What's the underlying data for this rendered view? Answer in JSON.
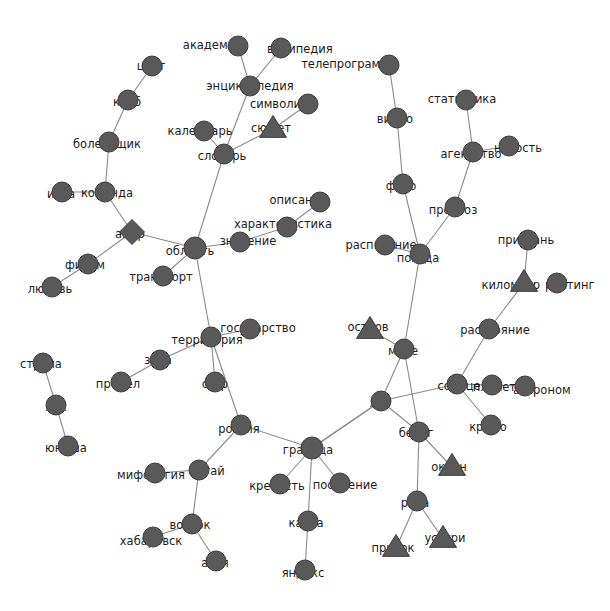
{
  "graph": {
    "title": "",
    "background_color": "#ffffff",
    "node_color": "#595959",
    "node_border_color": "#3c3c3c",
    "edge_color": "#8a8a8a",
    "label_color": "#1b1b1b",
    "width": 610,
    "height": 611,
    "shape_legend": {
      "circle": "circle-node",
      "triangle": "triangle-node",
      "diamond": "diamond-node"
    },
    "nodes": [
      {
        "id": "akademik",
        "label": "академик",
        "x": 238,
        "y": 46,
        "r": 10,
        "shape": "circle",
        "label_anchor": "end",
        "label_dx": 4,
        "label_dy": -1
      },
      {
        "id": "wikipedia",
        "label": "википедия",
        "x": 281,
        "y": 48,
        "r": 10,
        "shape": "circle",
        "label_anchor": "start",
        "label_dx": -14,
        "label_dy": 1
      },
      {
        "id": "entsiklopediya",
        "label": "энциклопедия",
        "x": 250,
        "y": 86,
        "r": 10,
        "shape": "circle",
        "label_anchor": "middle",
        "label_dx": 0,
        "label_dy": 0
      },
      {
        "id": "simvolika",
        "label": "символика",
        "x": 308,
        "y": 104,
        "r": 10,
        "shape": "circle",
        "label_anchor": "end",
        "label_dx": 7,
        "label_dy": 0
      },
      {
        "id": "syuzhet",
        "label": "сюжет",
        "x": 273,
        "y": 129,
        "r": 10,
        "shape": "triangle",
        "label_anchor": "middle",
        "label_dx": -2,
        "label_dy": -1
      },
      {
        "id": "kalendar",
        "label": "календарь",
        "x": 204,
        "y": 131,
        "r": 10,
        "shape": "circle",
        "label_anchor": "middle",
        "label_dx": -4,
        "label_dy": 0
      },
      {
        "id": "slovar",
        "label": "словарь",
        "x": 224,
        "y": 154,
        "r": 10,
        "shape": "circle",
        "label_anchor": "middle",
        "label_dx": -2,
        "label_dy": 2
      },
      {
        "id": "tsvet",
        "label": "цвет",
        "x": 152,
        "y": 66,
        "r": 10,
        "shape": "circle",
        "label_anchor": "middle",
        "label_dx": -1,
        "label_dy": 0
      },
      {
        "id": "klub",
        "label": "клуб",
        "x": 128,
        "y": 100,
        "r": 10,
        "shape": "circle",
        "label_anchor": "middle",
        "label_dx": -1,
        "label_dy": 2
      },
      {
        "id": "bolelshchik",
        "label": "болельщик",
        "x": 109,
        "y": 142,
        "r": 10,
        "shape": "circle",
        "label_anchor": "middle",
        "label_dx": -2,
        "label_dy": 2
      },
      {
        "id": "komanda",
        "label": "команда",
        "x": 105,
        "y": 192,
        "r": 10,
        "shape": "circle",
        "label_anchor": "middle",
        "label_dx": 2,
        "label_dy": 1
      },
      {
        "id": "igra",
        "label": "игра",
        "x": 62,
        "y": 192,
        "r": 10,
        "shape": "circle",
        "label_anchor": "middle",
        "label_dx": -1,
        "label_dy": 2
      },
      {
        "id": "amur",
        "label": "амур",
        "x": 132,
        "y": 232,
        "r": 10,
        "shape": "diamond",
        "label_anchor": "middle",
        "label_dx": -2,
        "label_dy": 2
      },
      {
        "id": "film",
        "label": "фильм",
        "x": 88,
        "y": 264,
        "r": 10,
        "shape": "circle",
        "label_anchor": "middle",
        "label_dx": -3,
        "label_dy": 1
      },
      {
        "id": "lyubov",
        "label": "любовь",
        "x": 52,
        "y": 287,
        "r": 10,
        "shape": "circle",
        "label_anchor": "middle",
        "label_dx": -2,
        "label_dy": 2
      },
      {
        "id": "oblast",
        "label": "область",
        "x": 195,
        "y": 248,
        "r": 11,
        "shape": "circle",
        "label_anchor": "middle",
        "label_dx": -5,
        "label_dy": 3
      },
      {
        "id": "znachenie",
        "label": "значение",
        "x": 240,
        "y": 242,
        "r": 10,
        "shape": "circle",
        "label_anchor": "middle",
        "label_dx": 8,
        "label_dy": -1
      },
      {
        "id": "harakteristika",
        "label": "характеристика",
        "x": 287,
        "y": 227,
        "r": 10,
        "shape": "circle",
        "label_anchor": "middle",
        "label_dx": -4,
        "label_dy": -3
      },
      {
        "id": "opisanie",
        "label": "описание",
        "x": 320,
        "y": 202,
        "r": 10,
        "shape": "circle",
        "label_anchor": "end",
        "label_dx": 7,
        "label_dy": -2
      },
      {
        "id": "transport",
        "label": "транспорт",
        "x": 163,
        "y": 276,
        "r": 10,
        "shape": "circle",
        "label_anchor": "middle",
        "label_dx": -2,
        "label_dy": 1
      },
      {
        "id": "territoriya",
        "label": "территория",
        "x": 211,
        "y": 337,
        "r": 10,
        "shape": "circle",
        "label_anchor": "middle",
        "label_dx": -4,
        "label_dy": 3
      },
      {
        "id": "gosudarstvo",
        "label": "государство",
        "x": 250,
        "y": 329,
        "r": 10,
        "shape": "circle",
        "label_anchor": "middle",
        "label_dx": 8,
        "label_dy": -1
      },
      {
        "id": "zona",
        "label": "зона",
        "x": 160,
        "y": 360,
        "r": 10,
        "shape": "circle",
        "label_anchor": "middle",
        "label_dx": -2,
        "label_dy": 0
      },
      {
        "id": "predel",
        "label": "предел",
        "x": 121,
        "y": 382,
        "r": 10,
        "shape": "circle",
        "label_anchor": "middle",
        "label_dx": -3,
        "label_dy": 2
      },
      {
        "id": "sssr",
        "label": "ссср",
        "x": 215,
        "y": 382,
        "r": 10,
        "shape": "circle",
        "label_anchor": "middle",
        "label_dx": 0,
        "label_dy": 2
      },
      {
        "id": "rossiya",
        "label": "россия",
        "x": 241,
        "y": 425,
        "r": 10,
        "shape": "circle",
        "label_anchor": "middle",
        "label_dx": -2,
        "label_dy": 4
      },
      {
        "id": "strela",
        "label": "стрела",
        "x": 43,
        "y": 363,
        "r": 10,
        "shape": "circle",
        "label_anchor": "middle",
        "label_dx": -2,
        "label_dy": 1
      },
      {
        "id": "luk",
        "label": "лук",
        "x": 56,
        "y": 405,
        "r": 10,
        "shape": "circle",
        "label_anchor": "middle",
        "label_dx": 0,
        "label_dy": 2
      },
      {
        "id": "yunosha",
        "label": "юноша",
        "x": 68,
        "y": 446,
        "r": 10,
        "shape": "circle",
        "label_anchor": "middle",
        "label_dx": -2,
        "label_dy": 2
      },
      {
        "id": "mifologiya",
        "label": "мифология",
        "x": 155,
        "y": 473,
        "r": 10,
        "shape": "circle",
        "label_anchor": "middle",
        "label_dx": -4,
        "label_dy": 2
      },
      {
        "id": "altay",
        "label": "алтай",
        "x": 199,
        "y": 470,
        "r": 10,
        "shape": "circle",
        "label_anchor": "middle",
        "label_dx": 8,
        "label_dy": 1
      },
      {
        "id": "vostok",
        "label": "восток",
        "x": 192,
        "y": 524,
        "r": 10,
        "shape": "circle",
        "label_anchor": "middle",
        "label_dx": -2,
        "label_dy": 1
      },
      {
        "id": "habarovsk",
        "label": "хабаровск",
        "x": 153,
        "y": 537,
        "r": 10,
        "shape": "circle",
        "label_anchor": "middle",
        "label_dx": -2,
        "label_dy": 4
      },
      {
        "id": "aziya",
        "label": "азия",
        "x": 216,
        "y": 561,
        "r": 10,
        "shape": "circle",
        "label_anchor": "middle",
        "label_dx": -1,
        "label_dy": 2
      },
      {
        "id": "granitsa",
        "label": "граница",
        "x": 312,
        "y": 448,
        "r": 11,
        "shape": "circle",
        "label_anchor": "middle",
        "label_dx": -4,
        "label_dy": 2
      },
      {
        "id": "krepost",
        "label": "крепость",
        "x": 280,
        "y": 484,
        "r": 10,
        "shape": "circle",
        "label_anchor": "middle",
        "label_dx": -3,
        "label_dy": 2
      },
      {
        "id": "poselenie",
        "label": "поселение",
        "x": 340,
        "y": 483,
        "r": 10,
        "shape": "circle",
        "label_anchor": "middle",
        "label_dx": 5,
        "label_dy": 2
      },
      {
        "id": "karta",
        "label": "карта",
        "x": 308,
        "y": 521,
        "r": 10,
        "shape": "circle",
        "label_anchor": "middle",
        "label_dx": -2,
        "label_dy": 2
      },
      {
        "id": "yandeks",
        "label": "яндекс",
        "x": 305,
        "y": 570,
        "r": 10,
        "shape": "circle",
        "label_anchor": "middle",
        "label_dx": -2,
        "label_dy": 3
      },
      {
        "id": "teleprogramma",
        "label": "телепрограмма",
        "x": 389,
        "y": 65,
        "r": 10,
        "shape": "circle",
        "label_anchor": "end",
        "label_dx": 7,
        "label_dy": -1
      },
      {
        "id": "video",
        "label": "видео",
        "x": 397,
        "y": 118,
        "r": 10,
        "shape": "circle",
        "label_anchor": "middle",
        "label_dx": -2,
        "label_dy": 1
      },
      {
        "id": "statistika",
        "label": "статистика",
        "x": 466,
        "y": 100,
        "r": 10,
        "shape": "circle",
        "label_anchor": "middle",
        "label_dx": -4,
        "label_dy": -1
      },
      {
        "id": "agentstvo",
        "label": "агентство",
        "x": 473,
        "y": 152,
        "r": 10,
        "shape": "circle",
        "label_anchor": "middle",
        "label_dx": -2,
        "label_dy": 2
      },
      {
        "id": "novost",
        "label": "новость",
        "x": 509,
        "y": 146,
        "r": 10,
        "shape": "circle",
        "label_anchor": "middle",
        "label_dx": 9,
        "label_dy": 2
      },
      {
        "id": "foto",
        "label": "фото",
        "x": 403,
        "y": 184,
        "r": 10,
        "shape": "circle",
        "label_anchor": "middle",
        "label_dx": -2,
        "label_dy": 2
      },
      {
        "id": "prognoz",
        "label": "прогноз",
        "x": 455,
        "y": 207,
        "r": 10,
        "shape": "circle",
        "label_anchor": "middle",
        "label_dx": -2,
        "label_dy": 3
      },
      {
        "id": "raspisanie",
        "label": "расписание",
        "x": 385,
        "y": 245,
        "r": 10,
        "shape": "circle",
        "label_anchor": "middle",
        "label_dx": -4,
        "label_dy": 0
      },
      {
        "id": "pogoda",
        "label": "погода",
        "x": 420,
        "y": 254,
        "r": 10,
        "shape": "circle",
        "label_anchor": "middle",
        "label_dx": -2,
        "label_dy": 4
      },
      {
        "id": "pristan",
        "label": "пристань",
        "x": 528,
        "y": 240,
        "r": 10,
        "shape": "circle",
        "label_anchor": "middle",
        "label_dx": -2,
        "label_dy": 0
      },
      {
        "id": "kilometr",
        "label": "километр",
        "x": 524,
        "y": 283,
        "r": 10,
        "shape": "triangle",
        "label_anchor": "end",
        "label_dx": 16,
        "label_dy": 2
      },
      {
        "id": "reyting",
        "label": "рейтинг",
        "x": 557,
        "y": 283,
        "r": 10,
        "shape": "circle",
        "label_anchor": "start",
        "label_dx": -12,
        "label_dy": 2
      },
      {
        "id": "rasstoyanie",
        "label": "расстояние",
        "x": 489,
        "y": 329,
        "r": 10,
        "shape": "circle",
        "label_anchor": "middle",
        "label_dx": 6,
        "label_dy": 1
      },
      {
        "id": "ostrov",
        "label": "остров",
        "x": 370,
        "y": 330,
        "r": 10,
        "shape": "triangle",
        "label_anchor": "middle",
        "label_dx": -2,
        "label_dy": -3
      },
      {
        "id": "more",
        "label": "море",
        "x": 404,
        "y": 349,
        "r": 10,
        "shape": "circle",
        "label_anchor": "middle",
        "label_dx": -1,
        "label_dy": 2
      },
      {
        "id": "solntse",
        "label": "солнце",
        "x": 457,
        "y": 384,
        "r": 10,
        "shape": "circle",
        "label_anchor": "middle",
        "label_dx": 2,
        "label_dy": 2
      },
      {
        "id": "planeta",
        "label": "планета",
        "x": 492,
        "y": 385,
        "r": 10,
        "shape": "circle",
        "label_anchor": "middle",
        "label_dx": 6,
        "label_dy": 2
      },
      {
        "id": "astronom",
        "label": "астроном",
        "x": 525,
        "y": 386,
        "r": 10,
        "shape": "circle",
        "label_anchor": "start",
        "label_dx": -12,
        "label_dy": 4
      },
      {
        "id": "krylo",
        "label": "крыло",
        "x": 491,
        "y": 425,
        "r": 10,
        "shape": "circle",
        "label_anchor": "middle",
        "label_dx": -3,
        "label_dy": 2
      },
      {
        "id": "les",
        "label": "лес",
        "x": 381,
        "y": 401,
        "r": 10,
        "shape": "circle",
        "label_anchor": "middle",
        "label_dx": -1,
        "label_dy": 2
      },
      {
        "id": "bereg",
        "label": "берег",
        "x": 419,
        "y": 432,
        "r": 10,
        "shape": "circle",
        "label_anchor": "middle",
        "label_dx": -3,
        "label_dy": 1
      },
      {
        "id": "okean",
        "label": "океан",
        "x": 452,
        "y": 467,
        "r": 10,
        "shape": "triangle",
        "label_anchor": "middle",
        "label_dx": -3,
        "label_dy": 0
      },
      {
        "id": "reka",
        "label": "река",
        "x": 417,
        "y": 501,
        "r": 10,
        "shape": "circle",
        "label_anchor": "middle",
        "label_dx": -2,
        "label_dy": 2
      },
      {
        "id": "pritok",
        "label": "приток",
        "x": 396,
        "y": 548,
        "r": 10,
        "shape": "triangle",
        "label_anchor": "middle",
        "label_dx": -3,
        "label_dy": 0
      },
      {
        "id": "ussuri",
        "label": "уссури",
        "x": 443,
        "y": 539,
        "r": 10,
        "shape": "triangle",
        "label_anchor": "middle",
        "label_dx": 2,
        "label_dy": -1
      }
    ],
    "edges": [
      {
        "source": "akademik",
        "target": "entsiklopediya"
      },
      {
        "source": "wikipedia",
        "target": "entsiklopediya"
      },
      {
        "source": "entsiklopediya",
        "target": "slovar"
      },
      {
        "source": "kalendar",
        "target": "slovar"
      },
      {
        "source": "syuzhet",
        "target": "slovar"
      },
      {
        "source": "syuzhet",
        "target": "simvolika"
      },
      {
        "source": "slovar",
        "target": "oblast"
      },
      {
        "source": "tsvet",
        "target": "klub"
      },
      {
        "source": "klub",
        "target": "bolelshchik"
      },
      {
        "source": "bolelshchik",
        "target": "komanda"
      },
      {
        "source": "igra",
        "target": "komanda"
      },
      {
        "source": "komanda",
        "target": "amur"
      },
      {
        "source": "amur",
        "target": "film"
      },
      {
        "source": "film",
        "target": "lyubov"
      },
      {
        "source": "amur",
        "target": "oblast"
      },
      {
        "source": "oblast",
        "target": "transport"
      },
      {
        "source": "oblast",
        "target": "znachenie"
      },
      {
        "source": "znachenie",
        "target": "harakteristika"
      },
      {
        "source": "harakteristika",
        "target": "opisanie"
      },
      {
        "source": "oblast",
        "target": "territoriya"
      },
      {
        "source": "territoriya",
        "target": "gosudarstvo"
      },
      {
        "source": "territoriya",
        "target": "zona"
      },
      {
        "source": "zona",
        "target": "predel"
      },
      {
        "source": "territoriya",
        "target": "sssr"
      },
      {
        "source": "territoriya",
        "target": "rossiya"
      },
      {
        "source": "strela",
        "target": "luk"
      },
      {
        "source": "luk",
        "target": "yunosha"
      },
      {
        "source": "rossiya",
        "target": "altay"
      },
      {
        "source": "altay",
        "target": "mifologiya"
      },
      {
        "source": "altay",
        "target": "vostok"
      },
      {
        "source": "vostok",
        "target": "habarovsk"
      },
      {
        "source": "vostok",
        "target": "aziya"
      },
      {
        "source": "rossiya",
        "target": "granitsa"
      },
      {
        "source": "granitsa",
        "target": "krepost"
      },
      {
        "source": "granitsa",
        "target": "poselenie"
      },
      {
        "source": "granitsa",
        "target": "karta"
      },
      {
        "source": "karta",
        "target": "yandeks"
      },
      {
        "source": "granitsa",
        "target": "les"
      },
      {
        "source": "teleprogramma",
        "target": "video"
      },
      {
        "source": "video",
        "target": "foto"
      },
      {
        "source": "foto",
        "target": "pogoda"
      },
      {
        "source": "statistika",
        "target": "agentstvo"
      },
      {
        "source": "agentstvo",
        "target": "novost"
      },
      {
        "source": "agentstvo",
        "target": "prognoz"
      },
      {
        "source": "prognoz",
        "target": "pogoda"
      },
      {
        "source": "raspisanie",
        "target": "pogoda"
      },
      {
        "source": "pogoda",
        "target": "more"
      },
      {
        "source": "pristan",
        "target": "kilometr"
      },
      {
        "source": "kilometr",
        "target": "rasstoyanie"
      },
      {
        "source": "rasstoyanie",
        "target": "solntse"
      },
      {
        "source": "ostrov",
        "target": "more"
      },
      {
        "source": "more",
        "target": "les"
      },
      {
        "source": "more",
        "target": "bereg"
      },
      {
        "source": "les",
        "target": "solntse"
      },
      {
        "source": "solntse",
        "target": "planeta"
      },
      {
        "source": "planeta",
        "target": "astronom"
      },
      {
        "source": "solntse",
        "target": "krylo"
      },
      {
        "source": "les",
        "target": "bereg"
      },
      {
        "source": "bereg",
        "target": "okean"
      },
      {
        "source": "bereg",
        "target": "reka"
      },
      {
        "source": "reka",
        "target": "pritok"
      },
      {
        "source": "reka",
        "target": "ussuri"
      },
      {
        "source": "les",
        "target": "granitsa"
      }
    ]
  }
}
